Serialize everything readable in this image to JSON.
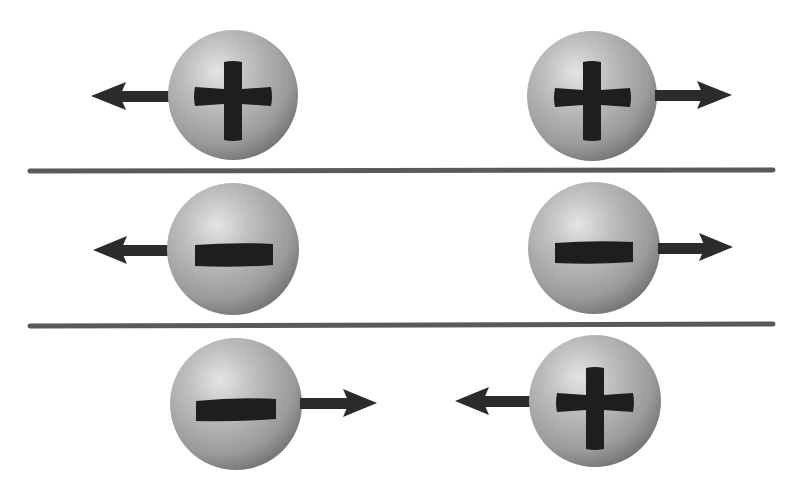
{
  "figure": {
    "caption_cut_off": ""
  },
  "colors": {
    "background": "#ffffff",
    "sphere_highlight": "#e2e2e2",
    "sphere_mid": "#a3a3a3",
    "sphere_edge": "#6a6a6a",
    "glyph": "#1e1e1e",
    "arrow": "#2b2b2b",
    "divider": "#5a5a5a"
  },
  "rows": [
    {
      "name": "like-positive-repel",
      "interaction": "repel",
      "charges": [
        {
          "sign": "+",
          "symbol": "plus",
          "cx": 233,
          "cy": 95,
          "r": 65,
          "force_direction": "left"
        },
        {
          "sign": "+",
          "symbol": "plus",
          "cx": 592,
          "cy": 96,
          "r": 65,
          "force_direction": "right"
        }
      ]
    },
    {
      "name": "like-negative-repel",
      "interaction": "repel",
      "charges": [
        {
          "sign": "-",
          "symbol": "minus",
          "cx": 233,
          "cy": 249,
          "r": 66,
          "force_direction": "left"
        },
        {
          "sign": "-",
          "symbol": "minus",
          "cx": 594,
          "cy": 248,
          "r": 66,
          "force_direction": "right"
        }
      ]
    },
    {
      "name": "unlike-attract",
      "interaction": "attract",
      "charges": [
        {
          "sign": "-",
          "symbol": "minus",
          "cx": 236,
          "cy": 404,
          "r": 66,
          "force_direction": "right"
        },
        {
          "sign": "+",
          "symbol": "plus",
          "cx": 595,
          "cy": 401,
          "r": 66,
          "force_direction": "left"
        }
      ]
    }
  ],
  "dividers": [
    {
      "y": 171,
      "x1": 30,
      "x2": 773
    },
    {
      "y": 325,
      "x1": 30,
      "x2": 773
    }
  ]
}
